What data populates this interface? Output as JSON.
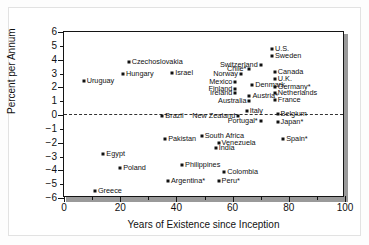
{
  "figure": {
    "y_axis_title": "Percent per Annum",
    "x_axis_title": "Years of Existence since Inception"
  },
  "chart_data": {
    "type": "scatter",
    "title": "",
    "xlabel": "Years of Existence since Inception",
    "ylabel": "Percent per Annum",
    "xlim": [
      0,
      100
    ],
    "ylim": [
      -6,
      6
    ],
    "xticks": [
      0,
      20,
      40,
      60,
      80,
      100
    ],
    "xtick_labels": [
      "0",
      "20",
      "40",
      "60",
      "80",
      "100"
    ],
    "yticks": [
      6,
      5,
      4,
      3,
      2,
      1,
      0,
      -1,
      -2,
      -3,
      -4,
      -5,
      -6
    ],
    "ytick_labels": [
      "6",
      "5",
      "4",
      "3",
      "2",
      "1",
      "0",
      "−1",
      "−2",
      "−3",
      "−4",
      "−5",
      "−6"
    ],
    "grid": false,
    "legend": false,
    "reference_line": {
      "y": 0,
      "style": "dashed"
    },
    "marker": {
      "shape": "square",
      "color": "#111111"
    },
    "points": [
      {
        "label": "Uruguay",
        "x": 7,
        "y": 2.45,
        "side": "right"
      },
      {
        "label": "Hungary",
        "x": 21,
        "y": 2.95,
        "side": "right"
      },
      {
        "label": "Czechoslovakia",
        "x": 23,
        "y": 3.85,
        "side": "right"
      },
      {
        "label": "Israel",
        "x": 38.5,
        "y": 3.05,
        "side": "right"
      },
      {
        "label": "Chile*",
        "x": 66,
        "y": 3.3,
        "side": "left"
      },
      {
        "label": "Norway",
        "x": 63,
        "y": 3.0,
        "side": "left"
      },
      {
        "label": "Switzerland",
        "x": 70,
        "y": 3.6,
        "side": "left"
      },
      {
        "label": "U.S.",
        "x": 74,
        "y": 4.75,
        "side": "right"
      },
      {
        "label": "Sweden",
        "x": 74,
        "y": 4.25,
        "side": "right"
      },
      {
        "label": "Canada",
        "x": 75,
        "y": 3.1,
        "side": "right"
      },
      {
        "label": "U.K.",
        "x": 75,
        "y": 2.6,
        "side": "right"
      },
      {
        "label": "Germany*",
        "x": 75,
        "y": 2.0,
        "side": "right"
      },
      {
        "label": "Netherlands",
        "x": 75,
        "y": 1.6,
        "side": "right"
      },
      {
        "label": "France",
        "x": 75,
        "y": 1.1,
        "side": "right"
      },
      {
        "label": "Mexico",
        "x": 61,
        "y": 2.35,
        "side": "left"
      },
      {
        "label": "Denmark",
        "x": 67,
        "y": 2.2,
        "side": "right"
      },
      {
        "label": "Finland",
        "x": 61,
        "y": 1.85,
        "side": "left"
      },
      {
        "label": "Ireland",
        "x": 61,
        "y": 1.6,
        "side": "left"
      },
      {
        "label": "Austria*",
        "x": 66,
        "y": 1.35,
        "side": "right"
      },
      {
        "label": "Australia",
        "x": 66,
        "y": 1.0,
        "side": "left"
      },
      {
        "label": "Italy",
        "x": 65,
        "y": 0.3,
        "side": "right"
      },
      {
        "label": "Belgium",
        "x": 76,
        "y": 0.05,
        "side": "right"
      },
      {
        "label": "Japan*",
        "x": 76,
        "y": -0.5,
        "side": "right"
      },
      {
        "label": "Portugal*",
        "x": 70,
        "y": -0.45,
        "side": "left"
      },
      {
        "label": "Brazil",
        "x": 35,
        "y": -0.05,
        "side": "right"
      },
      {
        "label": "New Zealand",
        "x": 62,
        "y": -0.05,
        "side": "left"
      },
      {
        "label": "Pakistan",
        "x": 36,
        "y": -1.75,
        "side": "right"
      },
      {
        "label": "South Africa",
        "x": 49,
        "y": -1.55,
        "side": "right"
      },
      {
        "label": "Venezuela",
        "x": 55,
        "y": -2.0,
        "side": "right"
      },
      {
        "label": "India",
        "x": 54,
        "y": -2.4,
        "side": "right"
      },
      {
        "label": "Spain*",
        "x": 78,
        "y": -1.75,
        "side": "right"
      },
      {
        "label": "Egypt",
        "x": 14,
        "y": -2.85,
        "side": "right"
      },
      {
        "label": "Poland",
        "x": 20,
        "y": -3.8,
        "side": "right"
      },
      {
        "label": "Philippines",
        "x": 42,
        "y": -3.65,
        "side": "right"
      },
      {
        "label": "Colombia",
        "x": 57,
        "y": -4.15,
        "side": "right"
      },
      {
        "label": "Argentina*",
        "x": 37,
        "y": -4.75,
        "side": "right"
      },
      {
        "label": "Peru*",
        "x": 55,
        "y": -4.75,
        "side": "right"
      },
      {
        "label": "Greece",
        "x": 11,
        "y": -5.5,
        "side": "right"
      }
    ]
  }
}
